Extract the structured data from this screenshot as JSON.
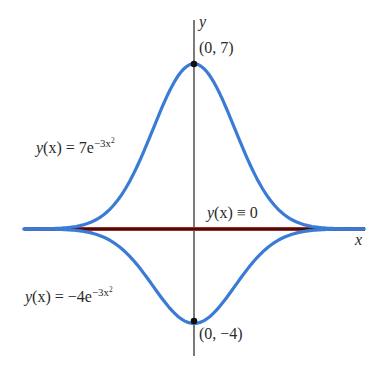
{
  "figure": {
    "axes": {
      "x_label": "x",
      "y_label": "y"
    },
    "colors": {
      "curve": "#3a7bd5",
      "zero_solution": "#5a1010",
      "zero_solution_edge": "#c0392b",
      "axis": "#222222",
      "point": "#111111",
      "text": "#2a2a2a"
    },
    "labels": {
      "top_curve": {
        "lhs": "y",
        "paren": "(x) = 7e",
        "exp": "−3x",
        "exp_pow": "2"
      },
      "bottom_curve": {
        "lhs": "y",
        "paren": "(x) = −4e",
        "exp": "−3x",
        "exp_pow": "2"
      },
      "zero_curve": {
        "lhs": "y",
        "rest": "(x) ≡ 0"
      },
      "top_point": "(0, 7)",
      "bottom_point": "(0, −4)"
    }
  },
  "chart_data": {
    "type": "line",
    "title": "",
    "xlabel": "x",
    "ylabel": "y",
    "grid": false,
    "series": [
      {
        "name": "y(x) = 7e^{-3x^2}",
        "formula": "7*exp(-3*x^2)",
        "color": "#3a7bd5"
      },
      {
        "name": "y(x) = -4e^{-3x^2}",
        "formula": "-4*exp(-3*x^2)",
        "color": "#3a7bd5"
      },
      {
        "name": "y(x) ≡ 0",
        "formula": "0",
        "color": "#5a1010"
      }
    ],
    "points": [
      {
        "label": "(0, 7)",
        "x": 0,
        "y": 7
      },
      {
        "label": "(0, −4)",
        "x": 0,
        "y": -4
      }
    ],
    "xlim": [
      -1.7,
      1.7
    ],
    "ylim": [
      -5.5,
      8.8
    ]
  }
}
